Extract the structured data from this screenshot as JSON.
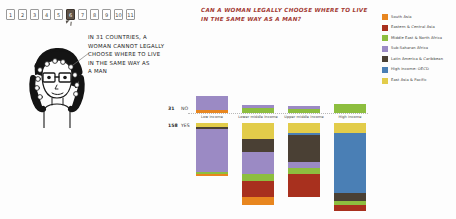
{
  "tabs": {
    "items": [
      "1",
      "2",
      "3",
      "4",
      "5",
      "6",
      "7",
      "8",
      "9",
      "10",
      "11"
    ],
    "selected_index": 5
  },
  "speech": {
    "line1": "IN 31 COUNTRIES, A",
    "line2": "WOMAN CANNOT LEGALLY",
    "line3": "CHOOSE WHERE TO LIVE",
    "line4": "IN THE SAME WAY AS",
    "line5": "A MAN"
  },
  "title": "Can a woman legally choose where to live in the same way as a man?",
  "legend": {
    "items": [
      {
        "label": "South Asia",
        "color": "#E8861F"
      },
      {
        "label": "Eastern & Central Asia",
        "color": "#A8301E"
      },
      {
        "label": "Middle East & North Africa",
        "color": "#8DBE3F"
      },
      {
        "label": "Sub-Saharan Africa",
        "color": "#9B8AC4"
      },
      {
        "label": "Latin America & Caribbean",
        "color": "#4A4034"
      },
      {
        "label": "High income: OECD",
        "color": "#4A7FB5"
      },
      {
        "label": "East Asia & Pacific",
        "color": "#E2CC4A"
      }
    ]
  },
  "chart_data": {
    "type": "bar",
    "title": "Can a woman legally choose where to live in the same way as a man?",
    "xlabel": "",
    "ylabel": "",
    "grid": false,
    "legend_position": "right",
    "answer_rows": [
      {
        "key": "no",
        "count": "31",
        "label": "NO"
      },
      {
        "key": "yes",
        "count": "158",
        "label": "YES"
      }
    ],
    "categories": [
      "Low income",
      "Lower middle income",
      "Upper middle income",
      "High income"
    ],
    "series": [
      {
        "name": "South Asia",
        "color": "#E8861F",
        "no": [
          3,
          0,
          0,
          0
        ],
        "yes": [
          1,
          4,
          0,
          0
        ]
      },
      {
        "name": "Eastern & Central Asia",
        "color": "#A8301E",
        "no": [
          0,
          0,
          0,
          0
        ],
        "yes": [
          0,
          8,
          12,
          3
        ]
      },
      {
        "name": "Middle East & North Africa",
        "color": "#8DBE3F",
        "no": [
          0,
          5,
          4,
          9
        ],
        "yes": [
          1,
          4,
          3,
          2
        ]
      },
      {
        "name": "Sub-Saharan Africa",
        "color": "#9B8AC4",
        "no": [
          15,
          3,
          3,
          0
        ],
        "yes": [
          22,
          11,
          3,
          0
        ]
      },
      {
        "name": "Latin America & Caribbean",
        "color": "#4A4034",
        "no": [
          0,
          0,
          0,
          0
        ],
        "yes": [
          1,
          7,
          14,
          4
        ]
      },
      {
        "name": "High income: OECD",
        "color": "#4A7FB5",
        "no": [
          0,
          0,
          0,
          0
        ],
        "yes": [
          0,
          0,
          1,
          31
        ]
      },
      {
        "name": "East Asia & Pacific",
        "color": "#E2CC4A",
        "no": [
          0,
          0,
          0,
          0
        ],
        "yes": [
          2,
          8,
          5,
          5
        ]
      }
    ],
    "totals": {
      "no": [
        18,
        8,
        7,
        9
      ],
      "yes": [
        27,
        42,
        38,
        45
      ]
    }
  }
}
